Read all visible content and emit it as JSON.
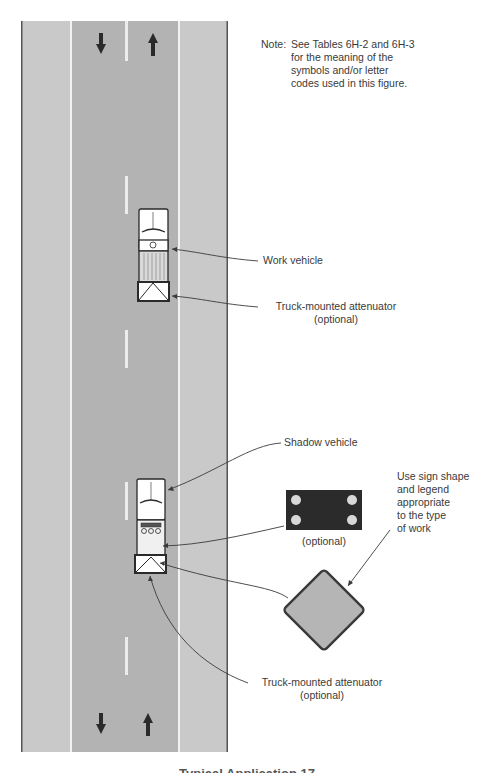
{
  "note": {
    "prefix": "Note:",
    "lines": [
      "See Tables 6H-2 and 6H-3",
      "for the meaning of the",
      "symbols and/or letter",
      "codes used in this figure."
    ]
  },
  "labels": {
    "work_vehicle": "Work vehicle",
    "tma_1": "Truck-mounted attenuator",
    "tma_1_optional": "(optional)",
    "shadow_vehicle": "Shadow vehicle",
    "arrow_board_optional": "(optional)",
    "sign_note": [
      "Use sign shape",
      "and legend",
      "appropriate",
      "to the type",
      "of work"
    ],
    "tma_2": "Truck-mounted attenuator",
    "tma_2_optional": "(optional)"
  },
  "caption": "Typical Application 17",
  "icons": {
    "lane_arrows": [
      "arrow-down-icon",
      "arrow-up-icon"
    ],
    "arrow_board": "arrow-board-icon",
    "warning_sign": "diamond-sign-icon"
  },
  "colors": {
    "shoulder": "#c9c9c9",
    "lane": "#b3b3b3",
    "road_edge": "#555555",
    "line_white": "#f2f2f2",
    "arrow": "#2a2a2a",
    "arrow_board": "#2b2b2b",
    "arrow_board_lights": "#d8d8d8",
    "sign_fill": "#b5b5b5",
    "sign_border": "#3a3a3a",
    "text": "#3a3a3a"
  }
}
